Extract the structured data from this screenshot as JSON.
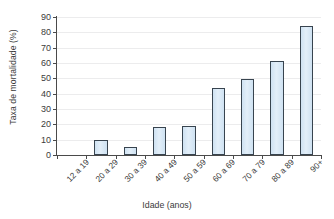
{
  "chart_data": {
    "type": "bar",
    "title": "",
    "subtitle": "",
    "xlabel": "Idade (anos)",
    "ylabel": "Taxa de mortalidade (%)",
    "categories": [
      "12 a 19",
      "20 a 29",
      "30 a 39",
      "40 a 49",
      "50 a 59",
      "60 a 69",
      "70 a 79",
      "80 a 89",
      "90+"
    ],
    "values": [
      0,
      10,
      5,
      18.5,
      18.7,
      43.5,
      49.3,
      61,
      84
    ],
    "series": [
      {
        "name": "Taxa de mortalidade (%)",
        "values": [
          0,
          10,
          5,
          18.5,
          18.7,
          43.5,
          49.3,
          61,
          84
        ]
      }
    ],
    "ylim": [
      0,
      90
    ],
    "yticks": [
      0,
      10,
      20,
      30,
      40,
      50,
      60,
      70,
      80,
      90
    ],
    "ytick_labels": [
      "0",
      "10",
      "20",
      "30",
      "40",
      "50",
      "60",
      "70",
      "80",
      "90"
    ],
    "grid": true,
    "grid_axis": "y",
    "legend": false,
    "legend_position": "none",
    "bar_fill_color": "#dbeaf7",
    "bar_edge_color": "#38444f",
    "axis_color": "#4a4a4a",
    "grid_color": "#ececed",
    "text_color": "#3b3b3b",
    "background_color": "#ffffff",
    "annotations": []
  }
}
